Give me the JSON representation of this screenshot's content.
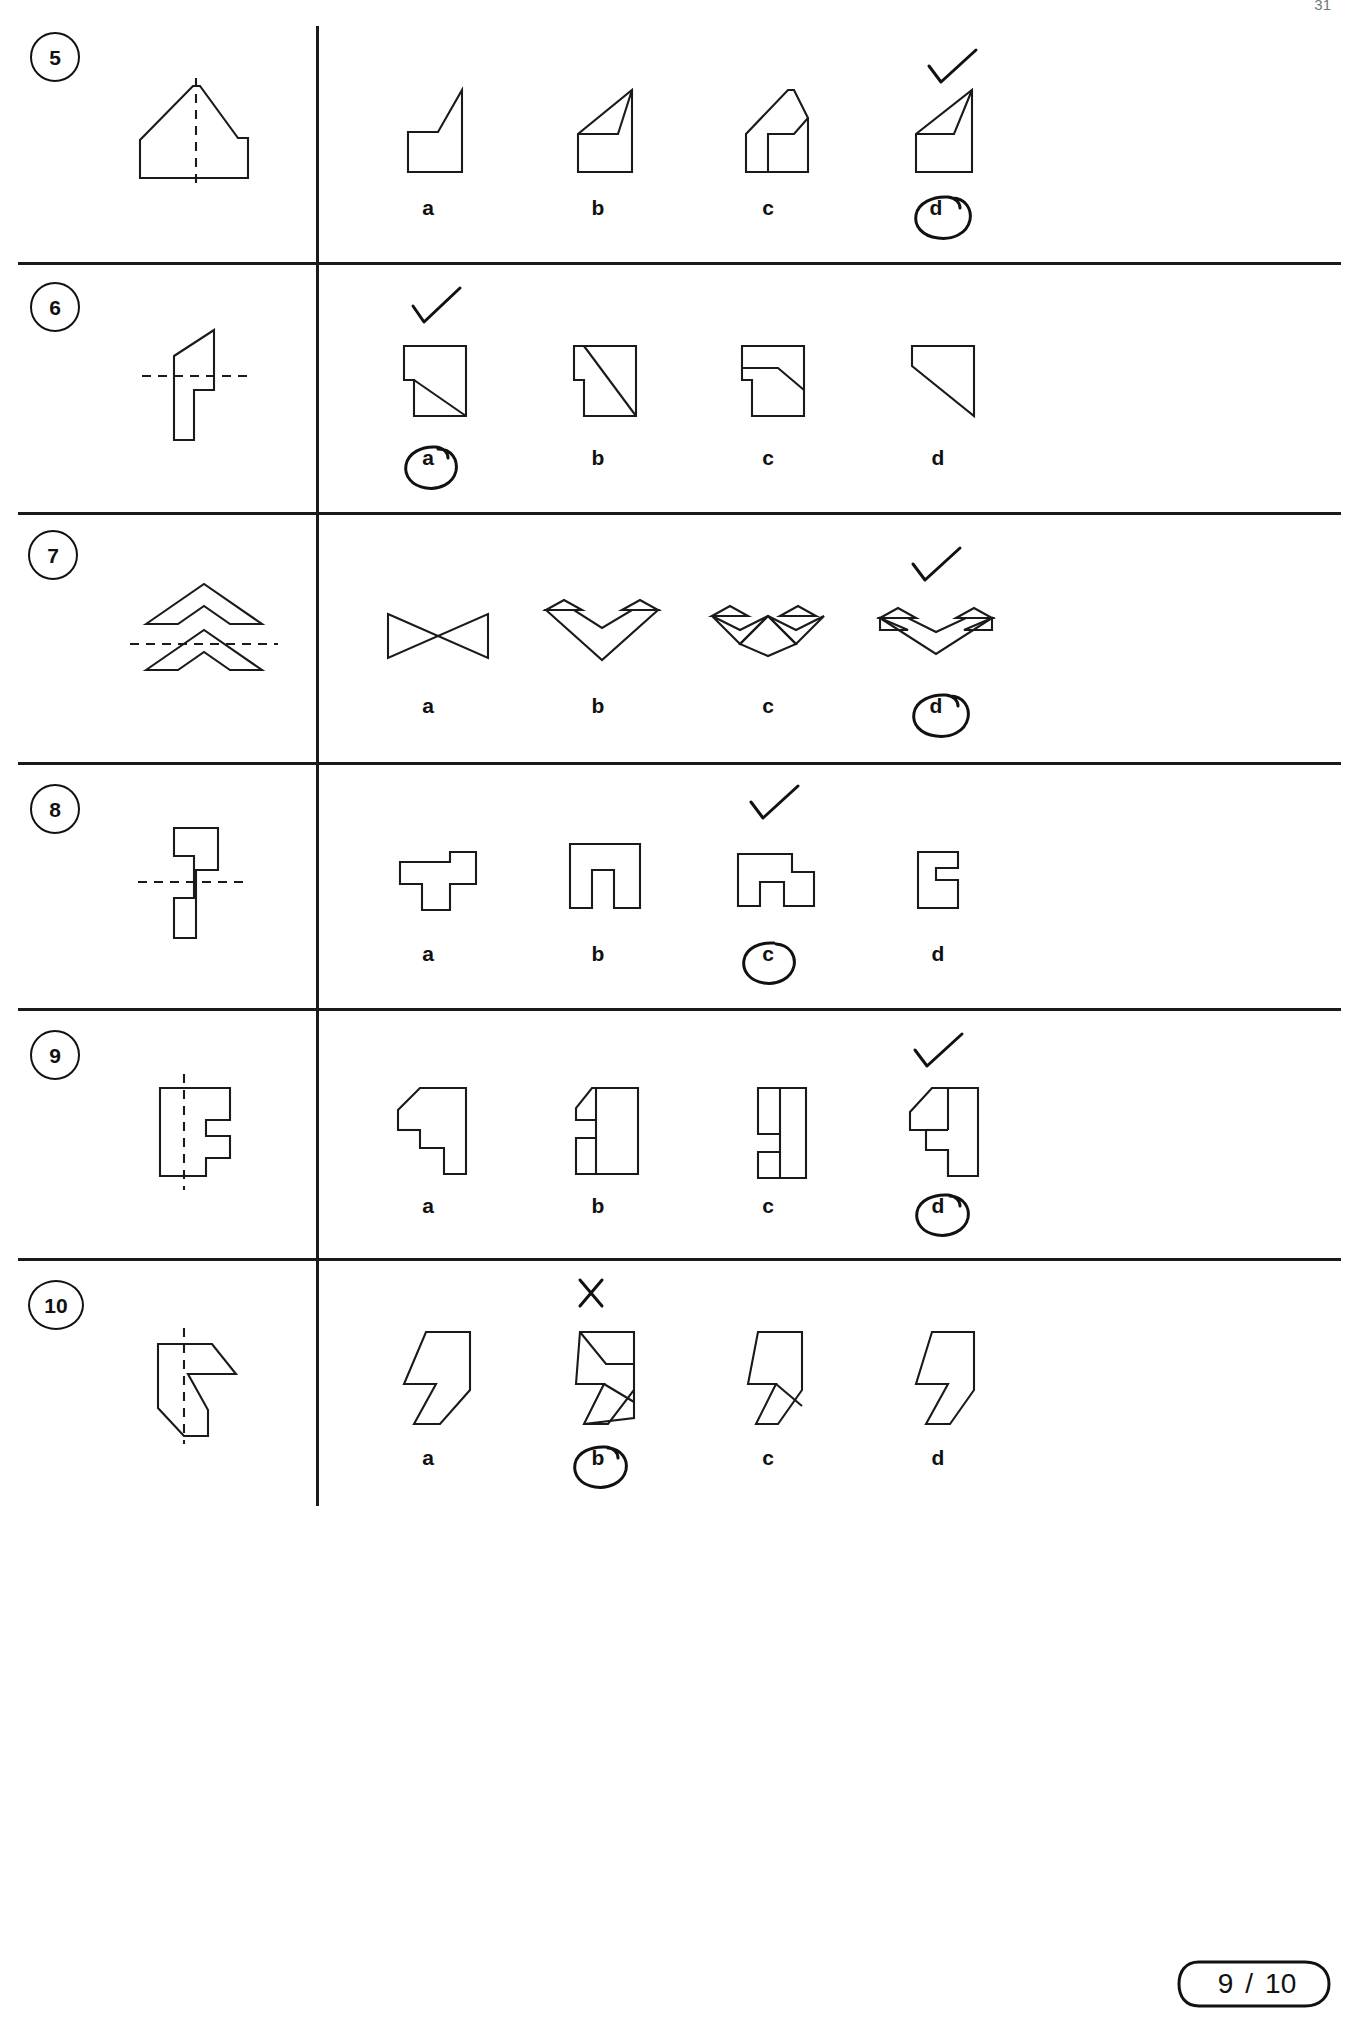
{
  "page": {
    "corner_mark": "31",
    "footer_score": "9",
    "footer_separator": "/",
    "footer_total": "10"
  },
  "option_labels": [
    "a",
    "b",
    "c",
    "d"
  ],
  "rows": [
    {
      "number": "5",
      "fold_axis": "vertical",
      "prompt_shape": "pentagon-house-with-step",
      "selected": "d",
      "tick_over": "d",
      "mark": "check",
      "options": [
        {
          "label": "a",
          "shape": "notched-wedge-a"
        },
        {
          "label": "b",
          "shape": "notched-wedge-b"
        },
        {
          "label": "c",
          "shape": "notched-wedge-c"
        },
        {
          "label": "d",
          "shape": "notched-wedge-d"
        }
      ]
    },
    {
      "number": "6",
      "fold_axis": "horizontal",
      "prompt_shape": "flag-stem",
      "selected": "a",
      "tick_over": "a",
      "mark": "check",
      "options": [
        {
          "label": "a",
          "shape": "block-slope-a"
        },
        {
          "label": "b",
          "shape": "block-slope-b"
        },
        {
          "label": "c",
          "shape": "block-slope-c"
        },
        {
          "label": "d",
          "shape": "block-slope-d"
        }
      ]
    },
    {
      "number": "7",
      "fold_axis": "horizontal",
      "prompt_shape": "double-chevron-arrow",
      "selected": "d",
      "tick_over": "d",
      "mark": "check",
      "options": [
        {
          "label": "a",
          "shape": "bowtie-a"
        },
        {
          "label": "b",
          "shape": "crown-triangle-b"
        },
        {
          "label": "c",
          "shape": "double-zigzag-c"
        },
        {
          "label": "d",
          "shape": "wide-crown-d"
        }
      ]
    },
    {
      "number": "8",
      "fold_axis": "horizontal",
      "prompt_shape": "z-block",
      "selected": "c",
      "tick_over": "c",
      "mark": "check",
      "options": [
        {
          "label": "a",
          "shape": "step-block-a"
        },
        {
          "label": "b",
          "shape": "step-block-b"
        },
        {
          "label": "c",
          "shape": "step-block-c"
        },
        {
          "label": "d",
          "shape": "step-block-d"
        }
      ]
    },
    {
      "number": "9",
      "fold_axis": "vertical",
      "prompt_shape": "notched-bar",
      "selected": "d",
      "tick_over": "d",
      "mark": "check",
      "options": [
        {
          "label": "a",
          "shape": "notched-bar-a"
        },
        {
          "label": "b",
          "shape": "notched-bar-b"
        },
        {
          "label": "c",
          "shape": "notched-bar-c"
        },
        {
          "label": "d",
          "shape": "notched-bar-d"
        }
      ]
    },
    {
      "number": "10",
      "fold_axis": "vertical",
      "prompt_shape": "arrow-pentagon",
      "selected": "b",
      "tick_over": "b",
      "mark": "cross",
      "options": [
        {
          "label": "a",
          "shape": "hook-a"
        },
        {
          "label": "b",
          "shape": "hook-b"
        },
        {
          "label": "c",
          "shape": "hook-c"
        },
        {
          "label": "d",
          "shape": "hook-d"
        }
      ]
    }
  ]
}
